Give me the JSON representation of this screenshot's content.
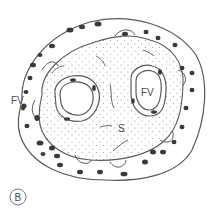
{
  "figure": {
    "panel_label": "B",
    "labels": {
      "fv_left": "FV",
      "fv_right": "FV",
      "stroma": "S"
    },
    "colors": {
      "line": "#5a5a5a",
      "nucleus": "#3a3a3a",
      "dot": "#9a9a9a",
      "background": "#ffffff"
    }
  }
}
